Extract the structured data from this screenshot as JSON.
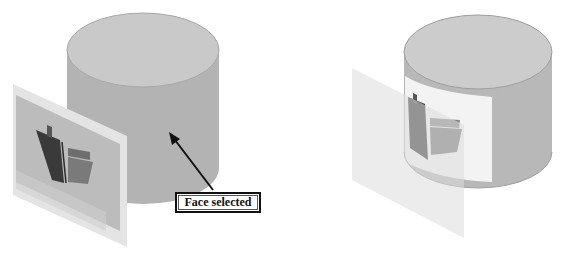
{
  "figure": {
    "left_panel": {
      "callout_label": "Face selected",
      "description": "Cylinder with decal image plane; cylindrical face selected"
    },
    "right_panel": {
      "description": "Decal image wrapped onto cylinder face"
    }
  },
  "colors": {
    "cylinder_top": "#c9c9c9",
    "cylinder_side": "#b3b3b3",
    "cylinder_edge": "#9a9a9a",
    "plane_frame": "#e6e6e6",
    "plane_image_bg": "#bdbdbd",
    "book_dark": "#3a3a3a",
    "book_mid": "#7a7a7a",
    "wrap_band": "#f2f2f2",
    "callout_border": "#111111"
  }
}
